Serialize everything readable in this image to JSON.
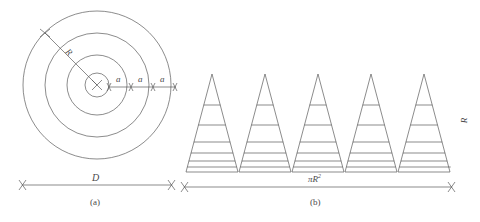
{
  "figure": {
    "stroke_color": "#5a5a5a",
    "background": "#ffffff",
    "panels": [
      {
        "id": "a",
        "caption": "(a)",
        "description": "Concentric circles with radius R, diameter D, and three equal radial segments a",
        "labels": {
          "radius": "R",
          "diameter": "D",
          "segment": "a"
        },
        "circle_count": 4,
        "segment_count": 3,
        "center": {
          "x": 97,
          "y": 85
        },
        "radii": [
          12,
          30,
          52,
          74
        ]
      },
      {
        "id": "b",
        "caption": "(b)",
        "description": "Five striped triangles of height R standing on a baseline of length pi R squared",
        "labels": {
          "base": "πR",
          "base_exponent": "2",
          "height": "R"
        },
        "triangle_count": 5,
        "stripes_per_triangle": 6,
        "apex_x": [
          212,
          265,
          318,
          371,
          424
        ],
        "apex_y": 74,
        "base_y": 172,
        "half_width": 26
      }
    ]
  }
}
